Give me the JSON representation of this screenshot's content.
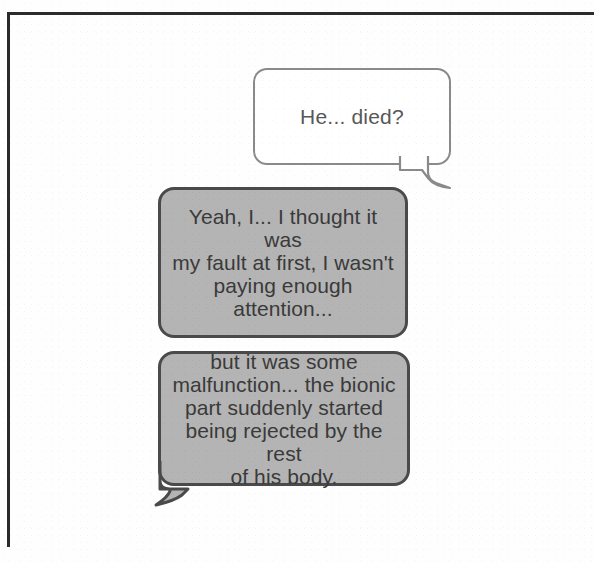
{
  "panel": {
    "name": "comic-panel",
    "background_color": "#fefefe",
    "border_color": "#2b2b2b"
  },
  "balloons": [
    {
      "id": "balloon-1",
      "speaker_side": "right",
      "text": "He... died?",
      "style": "outline",
      "fill_color": "#ffffff",
      "border_color": "#8a8a8a",
      "text_color": "#585858",
      "tail": "bottom-right"
    },
    {
      "id": "balloon-2",
      "speaker_side": "left",
      "text": "Yeah, I... I thought it was\nmy fault at first, I wasn't\npaying enough attention...",
      "style": "filled",
      "fill_color": "#b4b4b4",
      "border_color": "#4a4a4a",
      "text_color": "#3a3a3a",
      "tail": "none"
    },
    {
      "id": "balloon-3",
      "speaker_side": "left",
      "text": "but it was some\nmalfunction... the bionic\npart suddenly started\nbeing rejected by the rest\nof his body.",
      "style": "filled",
      "fill_color": "#b4b4b4",
      "border_color": "#4a4a4a",
      "text_color": "#3a3a3a",
      "tail": "bottom-left"
    }
  ]
}
